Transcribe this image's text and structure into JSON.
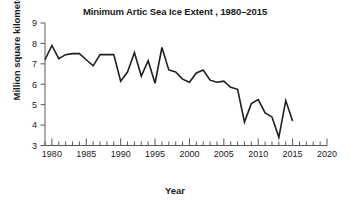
{
  "chart_data": {
    "type": "line",
    "title": "Minimum Artic Sea Ice Extent , 1980–2015",
    "xlabel": "Year",
    "ylabel": "Million square kilometers",
    "xlim": [
      1979,
      2020
    ],
    "ylim": [
      3,
      9
    ],
    "xticks": [
      1980,
      1985,
      1990,
      1995,
      2000,
      2005,
      2010,
      2015,
      2020
    ],
    "xtick_labels": [
      "1980",
      "1985",
      "1990",
      "1995",
      "2000",
      "2005",
      "2010",
      "2015",
      "2020"
    ],
    "x_minor_tick_step": 1,
    "yticks": [
      3,
      4,
      5,
      6,
      7,
      8,
      9
    ],
    "ytick_labels": [
      "3",
      "4",
      "5",
      "6",
      "7",
      "8",
      "9"
    ],
    "grid": false,
    "legend": "none",
    "line_color": "#1f1f1f",
    "line_width": 1.6,
    "x": [
      1979,
      1980,
      1981,
      1982,
      1983,
      1984,
      1985,
      1986,
      1987,
      1988,
      1989,
      1990,
      1991,
      1992,
      1993,
      1994,
      1995,
      1996,
      1997,
      1998,
      1999,
      2000,
      2001,
      2002,
      2003,
      2004,
      2005,
      2006,
      2007,
      2008,
      2009,
      2010,
      2011,
      2012,
      2013,
      2014,
      2015
    ],
    "values": [
      7.2,
      7.9,
      7.25,
      7.45,
      7.5,
      7.5,
      7.2,
      6.9,
      7.45,
      7.45,
      7.45,
      6.15,
      6.6,
      7.55,
      6.4,
      7.15,
      6.05,
      7.8,
      6.7,
      6.6,
      6.25,
      6.1,
      6.55,
      6.7,
      6.2,
      6.1,
      6.15,
      5.85,
      5.75,
      4.15,
      5.05,
      5.25,
      4.6,
      4.4,
      3.4,
      5.2,
      4.2
    ]
  }
}
